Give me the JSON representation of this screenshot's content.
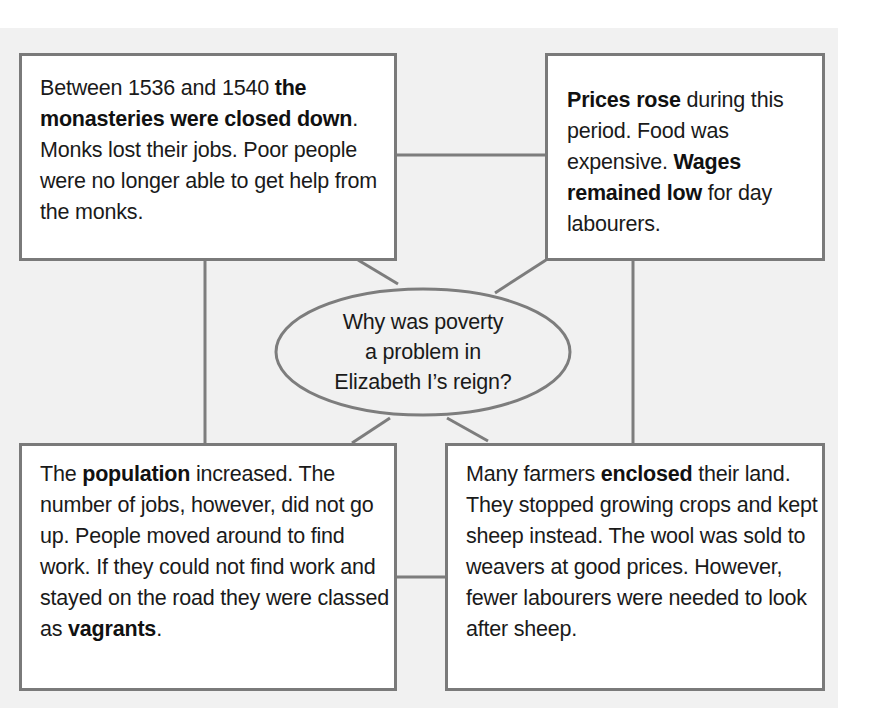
{
  "diagram": {
    "type": "mind-map",
    "center": {
      "line1": "Why was poverty",
      "line2": "a problem in",
      "line3": "Elizabeth I’s reign?"
    },
    "boxes": {
      "top_left": {
        "t1": "Between 1536 and 1540 ",
        "b1": "the monasteries were closed down",
        "t2": ". Monks lost their jobs. Poor people were no longer able to get help from the monks."
      },
      "top_right": {
        "b1": "Prices rose",
        "t1": " during this period. Food was expensive. ",
        "b2": "Wages remained low",
        "t2": " for day labourers."
      },
      "bottom_left": {
        "t1": "The ",
        "b1": "population",
        "t2": " increased. The number of jobs, however, did not go up. People moved around to find work. If they could not find work and stayed on the road they were classed as ",
        "b2": "vagrants",
        "t3": "."
      },
      "bottom_right": {
        "t1": "Many farmers ",
        "b1": "enclosed",
        "t2": " their land. They stopped growing crops and kept sheep instead. The wool was sold to weavers at good prices. However, fewer labourers were needed to look after sheep."
      }
    },
    "colors": {
      "background": "#f1f1f1",
      "border": "#7a7a7a",
      "box_fill": "#ffffff",
      "text": "#1a1a1a"
    }
  }
}
